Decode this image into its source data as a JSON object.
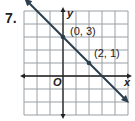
{
  "problem_number": "7.",
  "chart_data": {
    "type": "line",
    "title": "",
    "xlabel": "x",
    "ylabel": "y",
    "origin_label": "O",
    "xlim": [
      -3,
      5
    ],
    "ylim": [
      -3,
      5
    ],
    "grid": true,
    "line": {
      "slope": -1,
      "intercept": 3,
      "arrows_both_ends": true
    },
    "points": [
      {
        "x": 0,
        "y": 3,
        "label": "(0, 3)"
      },
      {
        "x": 2,
        "y": 1,
        "label": "(2, 1)"
      }
    ],
    "colors": {
      "line": "#2b3f4f",
      "grid": "#9aa0a6",
      "axis": "#222222"
    }
  }
}
